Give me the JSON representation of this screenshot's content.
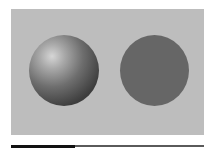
{
  "scene": {
    "panel_color": "#bdbdbd",
    "shaded_sphere": {
      "shape": "sphere",
      "shading": "gradient",
      "highlight": "upper-left"
    },
    "flat_circle": {
      "shape": "circle",
      "shading": "flat",
      "color": "#666666"
    }
  },
  "progress": {
    "percent": 33
  }
}
